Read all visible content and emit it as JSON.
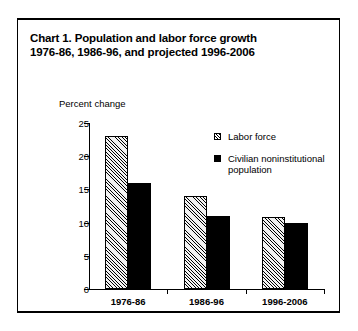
{
  "figure": {
    "title_line_1": "Chart 1. Population and labor force growth",
    "title_line_2": "1976-86, 1986-96, and projected 1996-2006"
  },
  "chart_data": {
    "type": "bar",
    "title": "Chart 1. Population and labor force growth 1976-86, 1986-96, and projected 1996-2006",
    "xlabel": "",
    "ylabel": "Percent change",
    "categories": [
      "1976-86",
      "1986-96",
      "1996-2006"
    ],
    "series": [
      {
        "name": "Labor force",
        "values": [
          23.0,
          14.0,
          10.8
        ],
        "pattern": "hatched"
      },
      {
        "name": "Civilian noninstitutional population",
        "values": [
          16.0,
          11.0,
          10.0
        ],
        "pattern": "solid"
      }
    ],
    "ylim": [
      0,
      25
    ],
    "yticks": [
      0,
      5,
      10,
      15,
      20,
      25
    ],
    "ytick_labels": [
      "0",
      "5",
      "10",
      "15",
      "20",
      "25"
    ],
    "grid": false,
    "legend_position": "upper right",
    "legend_entries": [
      "Labor force",
      "Civilian noninstitutional population"
    ]
  },
  "legend": {
    "labor_force": "Labor force",
    "population_line_1": "Civilian noninstitutional",
    "population_line_2": "population"
  },
  "colors": {
    "axis": "#000000",
    "solid_bar": "#000000",
    "hatched_bar_fill": "#f2f2f2",
    "background": "#ffffff"
  }
}
